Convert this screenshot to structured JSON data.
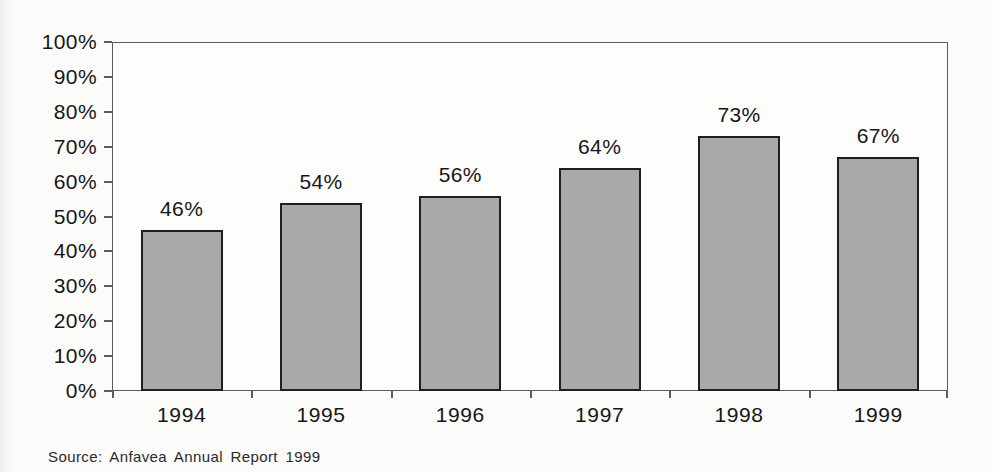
{
  "chart_data": {
    "type": "bar",
    "categories": [
      "1994",
      "1995",
      "1996",
      "1997",
      "1998",
      "1999"
    ],
    "values": [
      46,
      54,
      56,
      64,
      73,
      67
    ],
    "data_labels": [
      "46%",
      "54%",
      "56%",
      "64%",
      "73%",
      "67%"
    ],
    "y_tick_labels": [
      "0%",
      "10%",
      "20%",
      "30%",
      "40%",
      "50%",
      "60%",
      "70%",
      "80%",
      "90%",
      "100%"
    ],
    "y_tick_values": [
      0,
      10,
      20,
      30,
      40,
      50,
      60,
      70,
      80,
      90,
      100
    ],
    "ylim": [
      0,
      100
    ],
    "grid": false,
    "legend": "none",
    "source_note": "Source: Anfavea Annual Report 1999"
  },
  "colors": {
    "bar_fill": "#a9a9a9",
    "bar_border": "#1f1f1f",
    "axis_line": "#5d5d5d",
    "text": "#161616",
    "background": "#fbfbf9"
  }
}
